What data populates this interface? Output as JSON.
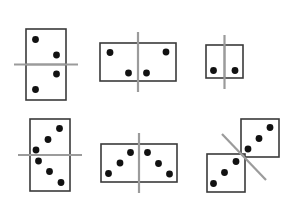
{
  "figure": {
    "background_color": "#ffffff",
    "width": 293,
    "height": 223,
    "tile_fill": "#ffffff",
    "tile_stroke": "#3a3a3a",
    "pip_color": "#111111",
    "axis_color": "#9b9b9b",
    "pip_radius": 3.4
  },
  "dominoes": [
    {
      "id": "domino-top-left",
      "label": "Vertical domino, 2 over 2, horizontal line",
      "orientation": "vertical",
      "position": "top-left",
      "pip_counts": [
        2,
        2
      ],
      "total_pips": 4,
      "line_type": "horizontal",
      "rect": {
        "x": 26,
        "y": 29,
        "w": 40,
        "h": 71
      },
      "internal_divider": {
        "x1": 26,
        "y1": 64.5,
        "x2": 66,
        "y2": 64.5
      },
      "axis": {
        "x1": 14,
        "y1": 64.5,
        "x2": 78,
        "y2": 64.5
      },
      "pips": [
        {
          "cx": 35.5,
          "cy": 39.5
        },
        {
          "cx": 56.5,
          "cy": 55.0
        },
        {
          "cx": 56.5,
          "cy": 74.0
        },
        {
          "cx": 35.5,
          "cy": 89.5
        }
      ]
    },
    {
      "id": "domino-top-middle",
      "label": "Horizontal domino, 2 and 2, vertical line",
      "orientation": "horizontal",
      "position": "top-middle",
      "pip_counts": [
        2,
        2
      ],
      "total_pips": 4,
      "line_type": "vertical",
      "rect": {
        "x": 100,
        "y": 43,
        "w": 76,
        "h": 38
      },
      "internal_divider": {
        "x1": 138,
        "y1": 43,
        "x2": 138,
        "y2": 81
      },
      "axis": {
        "x1": 138,
        "y1": 32,
        "x2": 138,
        "y2": 92
      },
      "pips": [
        {
          "cx": 110.0,
          "cy": 52.5
        },
        {
          "cx": 128.5,
          "cy": 73.0
        },
        {
          "cx": 146.5,
          "cy": 73.0
        },
        {
          "cx": 166.0,
          "cy": 52.0
        }
      ]
    },
    {
      "id": "domino-top-right",
      "label": "Small horizontal domino, 1 and 1, vertical line",
      "orientation": "horizontal",
      "position": "top-right",
      "pip_counts": [
        1,
        1
      ],
      "total_pips": 2,
      "line_type": "vertical",
      "rect": {
        "x": 206,
        "y": 45,
        "w": 37,
        "h": 33
      },
      "internal_divider": {
        "x1": 224.5,
        "y1": 45,
        "x2": 224.5,
        "y2": 78
      },
      "axis": {
        "x1": 224.5,
        "y1": 35,
        "x2": 224.5,
        "y2": 89
      },
      "pips": [
        {
          "cx": 213.5,
          "cy": 70.5
        },
        {
          "cx": 235.0,
          "cy": 70.5
        }
      ]
    },
    {
      "id": "domino-bottom-left",
      "label": "Vertical domino, 3 over 3, horizontal line",
      "orientation": "vertical",
      "position": "bottom-left",
      "pip_counts": [
        3,
        3
      ],
      "total_pips": 6,
      "line_type": "horizontal",
      "rect": {
        "x": 30,
        "y": 119,
        "w": 40,
        "h": 72
      },
      "internal_divider": {
        "x1": 30,
        "y1": 155,
        "x2": 70,
        "y2": 155
      },
      "axis": {
        "x1": 18,
        "y1": 155,
        "x2": 82,
        "y2": 155
      },
      "pips": [
        {
          "cx": 59.5,
          "cy": 128.5
        },
        {
          "cx": 48.0,
          "cy": 139.5
        },
        {
          "cx": 36.0,
          "cy": 150.0
        },
        {
          "cx": 38.5,
          "cy": 161.0
        },
        {
          "cx": 49.5,
          "cy": 171.5
        },
        {
          "cx": 61.0,
          "cy": 182.5
        }
      ]
    },
    {
      "id": "domino-bottom-middle",
      "label": "Horizontal domino, 3 and 3, vertical line",
      "orientation": "horizontal",
      "position": "bottom-middle",
      "pip_counts": [
        3,
        3
      ],
      "total_pips": 6,
      "line_type": "vertical",
      "rect": {
        "x": 101,
        "y": 144,
        "w": 76,
        "h": 38
      },
      "internal_divider": {
        "x1": 139,
        "y1": 144,
        "x2": 139,
        "y2": 182
      },
      "axis": {
        "x1": 139,
        "y1": 133,
        "x2": 139,
        "y2": 193
      },
      "pips": [
        {
          "cx": 130.5,
          "cy": 152.5
        },
        {
          "cx": 120.0,
          "cy": 163.0
        },
        {
          "cx": 108.5,
          "cy": 173.5
        },
        {
          "cx": 147.5,
          "cy": 152.5
        },
        {
          "cx": 158.5,
          "cy": 163.5
        },
        {
          "cx": 169.5,
          "cy": 174.0
        }
      ]
    },
    {
      "id": "domino-bottom-right",
      "label": "Two separated squares arranged diagonally, 3 and 3, diagonal line",
      "orientation": "diagonal",
      "position": "bottom-right",
      "pip_counts": [
        3,
        3
      ],
      "total_pips": 6,
      "line_type": "diagonal",
      "squares": [
        {
          "x": 241,
          "y": 119,
          "w": 38,
          "h": 38
        },
        {
          "x": 207,
          "y": 154,
          "w": 38,
          "h": 38
        }
      ],
      "axis": {
        "x1": 222,
        "y1": 134,
        "x2": 266,
        "y2": 180
      },
      "pips": [
        {
          "cx": 270.0,
          "cy": 127.5
        },
        {
          "cx": 259.0,
          "cy": 138.5
        },
        {
          "cx": 248.0,
          "cy": 149.0
        },
        {
          "cx": 236.0,
          "cy": 161.5
        },
        {
          "cx": 224.5,
          "cy": 172.5
        },
        {
          "cx": 213.5,
          "cy": 183.5
        }
      ]
    }
  ]
}
